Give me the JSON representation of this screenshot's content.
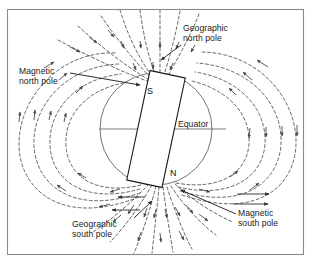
{
  "figure": {
    "border_color": "#8a8a8a",
    "background_color": "#ffffff",
    "line_color": "#4a4a4a",
    "solid_line_color": "#2b2b2b",
    "text_color": "#1a1a1a"
  },
  "labels": {
    "geographic_north_pole": "Geographic\nnorth pole",
    "magnetic_north_pole": "Magnetic\nnorth pole",
    "equator": "Equator",
    "geographic_south_pole": "Geographic\nsouth pole",
    "magnetic_south_pole": "Magnetic\nsouth pole"
  },
  "magnet": {
    "south_pole_letter": "S",
    "north_pole_letter": "N",
    "tilt_degrees": 12,
    "fill": "#ffffff",
    "stroke": "#1a1a1a"
  },
  "earth": {
    "center_x": 156,
    "center_y": 129,
    "radius": 56,
    "stroke": "#6d6d6d"
  },
  "equator_line": {
    "x1": 99,
    "x2": 226,
    "y": 129
  },
  "field_lines": {
    "style": "dashed",
    "dash_pattern": "3 2.4",
    "arrow_direction": "into north pole, out of south pole",
    "loop_count": 4
  }
}
